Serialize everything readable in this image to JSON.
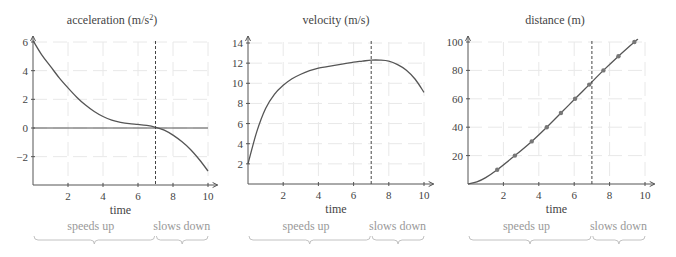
{
  "chart_data": [
    {
      "type": "line",
      "id": "acceleration",
      "title": "acceleration (m/s²)",
      "title_main": "acceleration (m/s",
      "title_sup": "2",
      "title_end": ")",
      "xlabel": "time",
      "ylabel": "",
      "xlim": [
        0,
        10.5
      ],
      "ylim": [
        -4,
        6.6
      ],
      "xticks": [
        2,
        4,
        6,
        8,
        10
      ],
      "yticks": [
        -2,
        0,
        2,
        4,
        6
      ],
      "grid": true,
      "reference_line_y": 0,
      "marker_x": 7,
      "x": [
        0,
        0.5,
        1,
        1.5,
        2,
        2.5,
        3,
        3.5,
        4,
        4.5,
        5,
        5.5,
        6,
        6.5,
        7,
        7.5,
        8,
        8.5,
        9,
        9.5,
        10
      ],
      "y": [
        6.1,
        5.1,
        4.3,
        3.5,
        2.8,
        2.15,
        1.6,
        1.15,
        0.8,
        0.55,
        0.4,
        0.3,
        0.25,
        0.18,
        0.05,
        -0.15,
        -0.5,
        -0.95,
        -1.5,
        -2.2,
        -3.0
      ]
    },
    {
      "type": "line",
      "id": "velocity",
      "title": "velocity (m/s)",
      "xlabel": "time",
      "ylabel": "",
      "xlim": [
        0,
        10.5
      ],
      "ylim": [
        0,
        14.8
      ],
      "xticks": [
        2,
        4,
        6,
        8,
        10
      ],
      "yticks": [
        2,
        4,
        6,
        8,
        10,
        12,
        14
      ],
      "grid": true,
      "marker_x": 7,
      "x": [
        0,
        0.5,
        1,
        1.5,
        2,
        2.5,
        3,
        3.5,
        4,
        4.5,
        5,
        5.5,
        6,
        6.5,
        7,
        7.5,
        8,
        8.5,
        9,
        9.5,
        10
      ],
      "y": [
        2,
        5.2,
        7.5,
        8.9,
        9.8,
        10.45,
        10.9,
        11.25,
        11.5,
        11.65,
        11.8,
        11.95,
        12.1,
        12.2,
        12.3,
        12.3,
        12.2,
        11.85,
        11.3,
        10.4,
        9.1
      ]
    },
    {
      "type": "line",
      "id": "distance",
      "title": "distance (m)",
      "xlabel": "time",
      "ylabel": "",
      "xlim": [
        0,
        10.5
      ],
      "ylim": [
        0,
        104
      ],
      "xticks": [
        2,
        4,
        6,
        8,
        10
      ],
      "yticks": [
        20,
        40,
        60,
        80,
        100
      ],
      "grid": true,
      "marker_x": 7,
      "x": [
        0,
        0.5,
        1,
        1.65,
        2.65,
        3.6,
        4.45,
        5.25,
        6.05,
        6.85,
        7.65,
        8.5,
        9.4,
        9.6
      ],
      "y": [
        0,
        1.5,
        4.5,
        10,
        20,
        30,
        40,
        50,
        60,
        70,
        80,
        90,
        100,
        102
      ],
      "markers": {
        "x": [
          1.65,
          2.65,
          3.6,
          4.45,
          5.25,
          6.05,
          6.85,
          7.65,
          8.5,
          9.4
        ],
        "y": [
          10,
          20,
          30,
          40,
          50,
          60,
          70,
          80,
          90,
          100
        ]
      }
    }
  ],
  "phases": {
    "speeds_up": "speeds up",
    "slows_down": "slows down"
  }
}
